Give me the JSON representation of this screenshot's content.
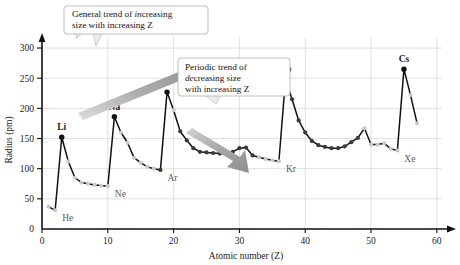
{
  "figure": {
    "name": "atomic-radius-vs-atomic-number",
    "background": "#ffffff"
  },
  "colors": {
    "line": "#111111",
    "point_dark": "#3a3a3a",
    "point_light": "#c9c9c9",
    "grid": "#d8d8d8",
    "axis": "#111111",
    "arrow_gray": "#9a9a9a",
    "callout_border": "#b5b5b5",
    "label_gray": "#5a5a5a"
  },
  "chart_data": {
    "type": "line",
    "title": "",
    "xlabel": "Atomic number (Z)",
    "ylabel": "Radius (pm)",
    "xlim": [
      0,
      62
    ],
    "ylim": [
      0,
      315
    ],
    "xticks": [
      0,
      10,
      20,
      30,
      40,
      50,
      60
    ],
    "yticks": [
      0,
      50,
      100,
      150,
      200,
      250,
      300
    ],
    "grid": true,
    "legend": null,
    "x": [
      1,
      2,
      3,
      4,
      5,
      6,
      7,
      8,
      9,
      10,
      11,
      12,
      13,
      14,
      15,
      16,
      17,
      18,
      19,
      20,
      21,
      22,
      23,
      24,
      25,
      26,
      27,
      28,
      29,
      30,
      31,
      32,
      33,
      34,
      35,
      36,
      37,
      38,
      39,
      40,
      41,
      42,
      43,
      44,
      45,
      46,
      47,
      48,
      49,
      50,
      51,
      52,
      53,
      54,
      55,
      56,
      57
    ],
    "values": [
      37,
      31,
      152,
      112,
      85,
      77,
      75,
      73,
      72,
      71,
      186,
      160,
      143,
      118,
      110,
      103,
      100,
      98,
      227,
      197,
      162,
      147,
      134,
      128,
      127,
      126,
      125,
      124,
      128,
      134,
      135,
      122,
      119,
      116,
      114,
      112,
      248,
      215,
      180,
      160,
      146,
      139,
      136,
      134,
      134,
      137,
      144,
      151,
      167,
      140,
      140,
      142,
      133,
      130,
      265,
      222,
      175
    ],
    "point_style_light_indices": [
      0,
      1,
      3,
      4,
      5,
      6,
      7,
      8,
      9,
      11,
      12,
      13,
      14,
      15,
      16,
      19,
      32,
      33,
      34,
      35,
      48,
      49,
      50,
      51,
      52,
      53,
      55,
      56
    ],
    "peaks": [
      {
        "label": "Li",
        "z": 3,
        "radius": 152,
        "emphasis": "bold"
      },
      {
        "label": "Na",
        "z": 11,
        "radius": 186,
        "emphasis": "bold"
      },
      {
        "label": "K",
        "z": 19,
        "radius": 227,
        "emphasis": "bold"
      },
      {
        "label": "Rb",
        "z": 37,
        "radius": 248,
        "emphasis": "bold"
      },
      {
        "label": "Cs",
        "z": 55,
        "radius": 265,
        "emphasis": "bold"
      }
    ],
    "minima": [
      {
        "label": "He",
        "z": 2,
        "radius": 31,
        "emphasis": "gray"
      },
      {
        "label": "Ne",
        "z": 10,
        "radius": 71,
        "emphasis": "gray"
      },
      {
        "label": "Ar",
        "z": 18,
        "radius": 98,
        "emphasis": "gray"
      },
      {
        "label": "Kr",
        "z": 36,
        "radius": 112,
        "emphasis": "gray"
      },
      {
        "label": "Xe",
        "z": 54,
        "radius": 130,
        "emphasis": "gray"
      }
    ],
    "annotations": [
      {
        "id": "increasing-trend",
        "line1_pre": "General trend of ",
        "line1_em": "in",
        "line1_post": "creasing",
        "line2": "size with increasing Z",
        "arrow": "up-right"
      },
      {
        "id": "decreasing-trend",
        "line1": "Periodic trend of",
        "line2_em": "de",
        "line2_post": "creasing size",
        "line3": "with increasing Z",
        "arrow": "down-right"
      }
    ]
  },
  "axes": {
    "x_tick_labels": [
      "0",
      "10",
      "20",
      "30",
      "40",
      "50",
      "60"
    ],
    "y_tick_labels": [
      "0",
      "50",
      "100",
      "150",
      "200",
      "250",
      "300"
    ],
    "x_title": "Atomic number (Z)",
    "y_title": "Radius (pm)"
  }
}
